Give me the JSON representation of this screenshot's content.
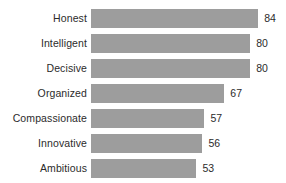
{
  "chart_data": {
    "type": "bar",
    "orientation": "horizontal",
    "title": "",
    "subtitle": "",
    "xlabel": "",
    "ylabel": "",
    "categories": [
      "Honest",
      "Intelligent",
      "Decisive",
      "Organized",
      "Compassionate",
      "Innovative",
      "Ambitious"
    ],
    "values": [
      84,
      80,
      80,
      67,
      57,
      56,
      53
    ],
    "value_labels": [
      "84",
      "80",
      "80",
      "67",
      "57",
      "56",
      "53"
    ],
    "series": [
      {
        "name": "",
        "values": [
          84,
          80,
          80,
          67,
          57,
          56,
          53
        ]
      }
    ],
    "xlim": [
      0,
      100
    ],
    "grid": false,
    "legend": false,
    "legend_position": "none",
    "axis_lines": false,
    "tick_labels": [],
    "annotations": [],
    "colors": {
      "bar": "#9d9d9d",
      "text": "#2b2b2b",
      "background": "#ffffff"
    }
  },
  "rows": [
    {
      "label": "Honest",
      "value": 84,
      "value_text": "84"
    },
    {
      "label": "Intelligent",
      "value": 80,
      "value_text": "80"
    },
    {
      "label": "Decisive",
      "value": 80,
      "value_text": "80"
    },
    {
      "label": "Organized",
      "value": 67,
      "value_text": "67"
    },
    {
      "label": "Compassionate",
      "value": 57,
      "value_text": "57"
    },
    {
      "label": "Innovative",
      "value": 56,
      "value_text": "56"
    },
    {
      "label": "Ambitious",
      "value": 53,
      "value_text": "53"
    }
  ]
}
